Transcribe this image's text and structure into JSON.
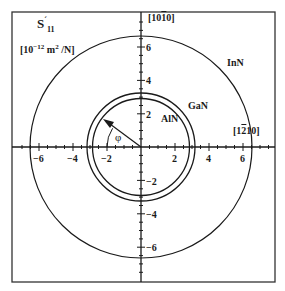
{
  "figure": {
    "quantity_symbol": "S",
    "quantity_prime": "´",
    "quantity_subscript": "11",
    "units_prefix": "[10",
    "units_exp": "−12",
    "units_mid": " m",
    "units_exp2": "2",
    "units_suffix": " /N]",
    "direction_top": {
      "pre": "[10",
      "bar": "1",
      "post": "0]"
    },
    "direction_right": {
      "pre": "[1",
      "bar": "2",
      "post": "10]"
    },
    "angle_label": "φ",
    "materials": [
      {
        "name": "InN",
        "radius": 6.6
      },
      {
        "name": "GaN",
        "radius": 3.2
      },
      {
        "name": "AlN",
        "radius": 2.9
      }
    ],
    "x_ticks": [
      "−6",
      "−4",
      "−2",
      "2",
      "4",
      "6"
    ],
    "y_ticks": [
      "6",
      "4",
      "2",
      "−2",
      "−4",
      "−6"
    ]
  },
  "colors": {
    "line": "#1a1a1a",
    "frame": "#333333",
    "background": "#ffffff"
  }
}
